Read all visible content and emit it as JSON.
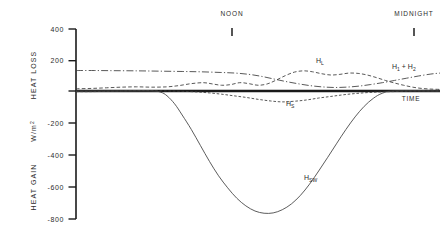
{
  "chart_data": {
    "type": "line",
    "title": "",
    "xlabel": "TIME",
    "ylabel": "W/m 2",
    "ylabel_upper": "HEAT LOSS",
    "ylabel_lower": "HEAT GAIN",
    "ylim": [
      -800,
      400
    ],
    "yticks": [
      400,
      200,
      0,
      -200,
      -400,
      -600,
      -800
    ],
    "ytick_labels": [
      "400",
      "200",
      "",
      "-200",
      "-400",
      "-600",
      "-800"
    ],
    "xlim": [
      0,
      24
    ],
    "grid": false,
    "legend": "none",
    "time_markers": [
      {
        "label": "NOON",
        "x": 12
      },
      {
        "label": "MIDNIGHT",
        "x": 22
      }
    ],
    "annotations": [
      {
        "text": "H",
        "sub": "L",
        "x": 15.0,
        "y": 175
      },
      {
        "text": "H",
        "sub": "1 + H 2",
        "x": 21.6,
        "y": 150
      },
      {
        "text": "H",
        "sub": "S",
        "x": 13.6,
        "y": -95
      },
      {
        "text": "H",
        "sub": "SW",
        "x": 15.2,
        "y": -515
      },
      {
        "text": "TIME",
        "sub": "",
        "x": 22.6,
        "y": -60
      }
    ],
    "series": [
      {
        "name": "H 1 + H 2",
        "style": "dash-dot",
        "label": "H1 + H2",
        "x": [
          0.0,
          1.2,
          2.5,
          4.0,
          5.5,
          7.0,
          8.2,
          9.5,
          10.5,
          11.4,
          12.2,
          13.0,
          13.8,
          14.6,
          15.4,
          16.2,
          17.0,
          17.8,
          18.6,
          19.4,
          20.2,
          21.0,
          21.8,
          22.6,
          23.4,
          24.0
        ],
        "values": [
          128,
          128,
          127,
          126,
          124,
          122,
          120,
          116,
          112,
          104,
          92,
          76,
          60,
          46,
          34,
          26,
          22,
          24,
          30,
          40,
          52,
          66,
          80,
          94,
          106,
          112
        ]
      },
      {
        "name": "H L",
        "style": "dashed",
        "label": "HL",
        "x": [
          0.0,
          1.0,
          2.0,
          3.0,
          4.0,
          5.0,
          6.0,
          6.8,
          7.6,
          8.4,
          9.0,
          9.6,
          10.2,
          10.8,
          11.4,
          12.0,
          12.6,
          13.2,
          13.8,
          14.4,
          15.0,
          15.6,
          16.2,
          16.8,
          17.4,
          18.0,
          18.6,
          19.2,
          19.8,
          20.4,
          21.0,
          21.6,
          22.2,
          22.8,
          23.4,
          24.0
        ],
        "values": [
          14,
          16,
          20,
          24,
          26,
          24,
          26,
          34,
          46,
          52,
          44,
          36,
          40,
          52,
          46,
          36,
          44,
          68,
          96,
          118,
          126,
          120,
          108,
          100,
          104,
          112,
          110,
          100,
          84,
          66,
          50,
          36,
          24,
          16,
          12,
          10
        ]
      },
      {
        "name": "H S",
        "style": "dashed-fine",
        "label": "HS",
        "x": [
          0.0,
          1.0,
          2.0,
          3.0,
          4.0,
          5.0,
          6.0,
          7.0,
          8.0,
          8.8,
          9.6,
          10.4,
          11.2,
          12.0,
          12.8,
          13.6,
          14.4,
          15.2,
          16.0,
          16.8,
          17.6,
          18.4,
          19.2,
          20.0,
          20.8,
          21.6,
          22.4,
          23.2,
          24.0
        ],
        "values": [
          -4,
          -4,
          -2,
          0,
          2,
          2,
          0,
          -2,
          -6,
          -12,
          -20,
          -30,
          -40,
          -52,
          -62,
          -68,
          -64,
          -56,
          -44,
          -34,
          -24,
          -16,
          -10,
          -6,
          -4,
          -2,
          0,
          0,
          0
        ]
      },
      {
        "name": "H SW",
        "style": "solid",
        "label": "HSW",
        "x": [
          0.0,
          3.0,
          5.0,
          5.6,
          6.0,
          6.5,
          7.0,
          7.6,
          8.2,
          8.8,
          9.4,
          10.0,
          10.6,
          11.2,
          11.8,
          12.4,
          13.0,
          13.6,
          14.2,
          14.8,
          15.4,
          16.0,
          16.6,
          17.2,
          17.8,
          18.4,
          19.0,
          19.6,
          20.2,
          21.0,
          24.0
        ],
        "values": [
          0,
          0,
          0,
          -8,
          -30,
          -80,
          -150,
          -240,
          -340,
          -440,
          -530,
          -605,
          -670,
          -718,
          -750,
          -764,
          -762,
          -742,
          -706,
          -652,
          -582,
          -500,
          -414,
          -326,
          -240,
          -162,
          -96,
          -46,
          -14,
          0,
          0
        ]
      }
    ]
  },
  "geometry": {
    "plot_left": 76,
    "plot_right": 440,
    "zero_y": 91,
    "top_y": 29,
    "bottom_y": 219,
    "axis_color": "#1a1a1a",
    "curve_color": "#3b3b3b"
  }
}
